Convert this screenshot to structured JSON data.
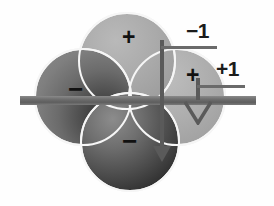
{
  "figure": {
    "background_color": "#fefefe",
    "width": 274,
    "height": 206
  },
  "axis_labels": [
    {
      "id": "minus-one",
      "text": "−1",
      "leader": "horizontal-line-to-vertical-axis"
    },
    {
      "id": "plus-one",
      "text": "+1",
      "leader": "horizontal-line-to-arrow"
    }
  ],
  "lobes": [
    {
      "id": "top",
      "sign": "+",
      "shade": "light-gray",
      "color": "#a8a8a8"
    },
    {
      "id": "right",
      "sign": "+",
      "shade": "light-gray",
      "color": "#ababab"
    },
    {
      "id": "left",
      "sign": "−",
      "shade": "dark-gray",
      "color": "#5e5e5e"
    },
    {
      "id": "bottom",
      "sign": "−",
      "shade": "dark",
      "color": "#333333"
    }
  ],
  "signs": {
    "top": "+",
    "right": "+",
    "left": "−",
    "bottom": "−"
  },
  "elements": {
    "horizontal_bar": {
      "name": "horizontal-plane-bar",
      "color": "#6f6f6f"
    },
    "vertical_axis": {
      "name": "vertical-axis-arrow",
      "color": "#5a5a5a"
    },
    "secondary_arrow": {
      "name": "secondary-down-arrow",
      "color": "#5a5a5a"
    }
  },
  "colors": {
    "ink": "#1b1b1b",
    "bar": "#6f6f6f",
    "axis": "#5a5a5a",
    "seam": "#f6f6f6",
    "lobe_light": "#ababab",
    "lobe_dark": "#333333"
  }
}
